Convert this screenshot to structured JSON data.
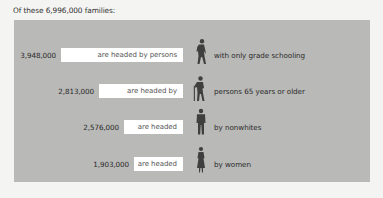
{
  "title": "Of these 6,996,000 families:",
  "colors": {
    "panel_bg": "#b9b9b7",
    "box_bg": "#ffffff",
    "figure": "#3f3f3f",
    "page_bg": "#f4f4f2"
  },
  "rows": [
    {
      "count": "3,948,000",
      "value": 3948000,
      "box_label": "are headed by persons",
      "icon": "walking-man-icon",
      "description": "with only grade schooling"
    },
    {
      "count": "2,813,000",
      "value": 2813000,
      "box_label": "are headed by",
      "icon": "elderly-man-with-cane-icon",
      "description": "persons 65 years or older"
    },
    {
      "count": "2,576,000",
      "value": 2576000,
      "box_label": "are headed",
      "icon": "standing-man-icon",
      "description": "by nonwhites"
    },
    {
      "count": "1,903,000",
      "value": 1903000,
      "box_label": "are headed",
      "icon": "standing-woman-icon",
      "description": "by women"
    }
  ]
}
